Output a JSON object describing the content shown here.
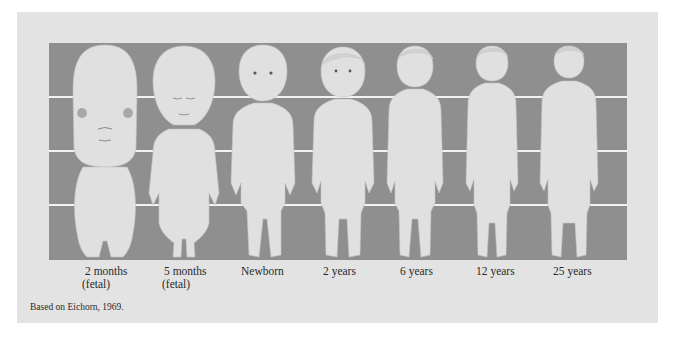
{
  "figure": {
    "colors": {
      "background": "#e3e3e3",
      "band": "#8f8f8f",
      "gridline": "#f2f2f2",
      "body": "#e0e0e0",
      "text": "#2a2a2a"
    },
    "stages": [
      {
        "label": "2 months",
        "sublabel": "(fetal)"
      },
      {
        "label": "5 months",
        "sublabel": "(fetal)"
      },
      {
        "label": "Newborn",
        "sublabel": ""
      },
      {
        "label": "2 years",
        "sublabel": ""
      },
      {
        "label": "6 years",
        "sublabel": ""
      },
      {
        "label": "12 years",
        "sublabel": ""
      },
      {
        "label": "25 years",
        "sublabel": ""
      }
    ],
    "head_to_body_ratio_note": "Head proportion decreases from about 1/2 body length (2 months fetal) to 1/8 (adult)",
    "gridlines": 3
  },
  "caption": "Based on Eichorn, 1969."
}
